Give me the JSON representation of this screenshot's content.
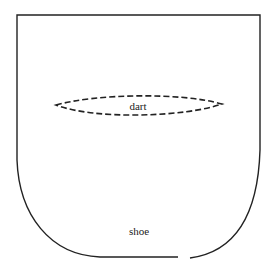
{
  "diagram": {
    "type": "pattern-piece",
    "colors": {
      "outline": "#222222",
      "background": "#ffffff"
    },
    "labels": {
      "dart": "dart",
      "shoe": "shoe"
    },
    "elements": [
      {
        "name": "pattern-outline",
        "description": "U-shaped sock/bootie pattern piece: flat top edge, straight sides curving into rounded bottom, small gap at bottom right"
      },
      {
        "name": "dart",
        "description": "Dashed lens-shaped dart marking across upper middle"
      },
      {
        "name": "shoe-label",
        "description": "Text label near bottom center"
      }
    ]
  }
}
